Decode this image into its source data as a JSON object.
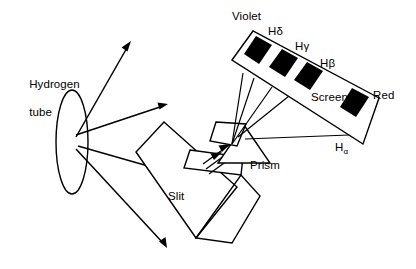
{
  "figure": {
    "type": "optics-ray-diagram",
    "background_color": "#ffffff",
    "ink_color": "#000000",
    "width": 416,
    "height": 269
  },
  "labels": {
    "source_line1": "Hydrogen",
    "source_line2": "tube",
    "slit": "Slit",
    "prism": "Prism",
    "screen": "Screen",
    "violet_end": "Violet",
    "red_end": "Red",
    "line_h_delta": "Hδ",
    "line_h_gamma": "Hγ",
    "line_h_beta": "Hβ",
    "line_h_alpha_base": "H",
    "line_h_alpha_sub": "α"
  },
  "spectrum": {
    "screen_label": "Screen",
    "short_wavelength_end": "Violet",
    "long_wavelength_end": "Red",
    "line_count": 4,
    "lines": [
      {
        "name": "Hδ",
        "order": 1,
        "color_region": "Violet"
      },
      {
        "name": "Hγ",
        "order": 2,
        "color_region": "Violet-Blue"
      },
      {
        "name": "Hβ",
        "order": 3,
        "color_region": "Blue-Green"
      },
      {
        "name": "Hα",
        "order": 4,
        "color_region": "Red"
      }
    ]
  },
  "components": [
    {
      "name": "Hydrogen tube",
      "shape": "ellipse"
    },
    {
      "name": "Slit",
      "shape": "rotated-rectangle-with-aperture"
    },
    {
      "name": "Prism",
      "shape": "triangle"
    },
    {
      "name": "Screen",
      "shape": "rotated-rectangle-with-bands"
    }
  ]
}
